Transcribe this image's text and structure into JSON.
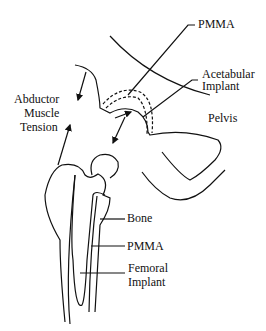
{
  "diagram": {
    "type": "hip-implant-schematic",
    "labels": {
      "pmma_top": "PMMA",
      "acetabular_1": "Acetabular",
      "acetabular_2": "Implant",
      "pelvis": "Pelvis",
      "abductor_1": "Abductor",
      "abductor_2": "Muscle",
      "abductor_3": "Tension",
      "bone": "Bone",
      "pmma_bottom": "PMMA",
      "femoral_1": "Femoral",
      "femoral_2": "Implant"
    },
    "colors": {
      "stroke": "#111111",
      "background": "#ffffff"
    }
  }
}
